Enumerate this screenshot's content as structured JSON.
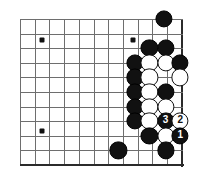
{
  "board": {
    "kind": "go-board-diagram",
    "description": "Go (baduk) life-and-death diagram showing the lower right corner area with a numbered move sequence 1-2-3",
    "geometry": {
      "origin_x": 20,
      "origin_y": 19,
      "spacing_x": 14.7,
      "spacing_y": 14.6,
      "cols": 12,
      "rows": 11,
      "edge_right_col": 11,
      "edge_bottom_row": 10
    },
    "colors": {
      "background": "#ffffff",
      "grid_line": "#6e6e6e",
      "edge_line": "#2b2b2b",
      "black_stone": "#111111",
      "white_stone": "#ffffff",
      "black_label_text": "#ffffff",
      "white_label_text": "#111111"
    },
    "star_points": [
      {
        "col": 1.5,
        "row": 1.45
      },
      {
        "col": 7.7,
        "row": 1.45
      },
      {
        "col": 1.5,
        "row": 7.7
      }
    ],
    "stones": [
      {
        "id": "b-top-right",
        "color": "black",
        "col": 9.8,
        "row": 0.0,
        "label": ""
      },
      {
        "id": "b-r2-c9",
        "color": "black",
        "col": 8.8,
        "row": 2.0,
        "label": ""
      },
      {
        "id": "b-r2-c10",
        "color": "black",
        "col": 9.9,
        "row": 2.0,
        "label": ""
      },
      {
        "id": "b-r3-c8",
        "color": "black",
        "col": 7.8,
        "row": 3.0,
        "label": ""
      },
      {
        "id": "w-r3-c9",
        "color": "white",
        "col": 8.8,
        "row": 3.0,
        "label": ""
      },
      {
        "id": "w-r3-c10",
        "color": "white",
        "col": 9.9,
        "row": 3.0,
        "label": ""
      },
      {
        "id": "b-r3-c11",
        "color": "black",
        "col": 10.9,
        "row": 3.0,
        "label": ""
      },
      {
        "id": "b-r4-c8",
        "color": "black",
        "col": 7.8,
        "row": 4.0,
        "label": ""
      },
      {
        "id": "w-r4-c9",
        "color": "white",
        "col": 8.8,
        "row": 4.0,
        "label": ""
      },
      {
        "id": "w-r4-c11",
        "color": "white",
        "col": 10.9,
        "row": 4.0,
        "label": ""
      },
      {
        "id": "b-r5-c8",
        "color": "black",
        "col": 7.8,
        "row": 5.0,
        "label": ""
      },
      {
        "id": "w-r5-c9",
        "color": "white",
        "col": 8.8,
        "row": 5.0,
        "label": ""
      },
      {
        "id": "b-r5-c10",
        "color": "black",
        "col": 9.9,
        "row": 5.0,
        "label": ""
      },
      {
        "id": "b-r6-c8",
        "color": "black",
        "col": 7.8,
        "row": 6.0,
        "label": ""
      },
      {
        "id": "w-r6-c9",
        "color": "white",
        "col": 8.8,
        "row": 6.0,
        "label": ""
      },
      {
        "id": "w-r6-c10",
        "color": "white",
        "col": 9.9,
        "row": 6.0,
        "label": ""
      },
      {
        "id": "b-r7-c8",
        "color": "black",
        "col": 7.8,
        "row": 7.0,
        "label": ""
      },
      {
        "id": "w-r7-c9",
        "color": "white",
        "col": 8.8,
        "row": 7.0,
        "label": ""
      },
      {
        "id": "move-3",
        "color": "black",
        "col": 9.9,
        "row": 7.0,
        "label": "3"
      },
      {
        "id": "move-2",
        "color": "white",
        "col": 10.9,
        "row": 7.0,
        "label": "2"
      },
      {
        "id": "b-r8-c9",
        "color": "black",
        "col": 8.8,
        "row": 8.0,
        "label": ""
      },
      {
        "id": "w-r8-c10",
        "color": "white",
        "col": 9.9,
        "row": 8.0,
        "label": ""
      },
      {
        "id": "move-1",
        "color": "black",
        "col": 10.9,
        "row": 8.0,
        "label": "1"
      },
      {
        "id": "b-r9-c7",
        "color": "black",
        "col": 6.7,
        "row": 9.0,
        "label": ""
      },
      {
        "id": "b-r9-c10",
        "color": "black",
        "col": 9.9,
        "row": 9.0,
        "label": ""
      }
    ],
    "move_sequence": [
      {
        "number": "1",
        "color": "black"
      },
      {
        "number": "2",
        "color": "white"
      },
      {
        "number": "3",
        "color": "black"
      }
    ]
  }
}
